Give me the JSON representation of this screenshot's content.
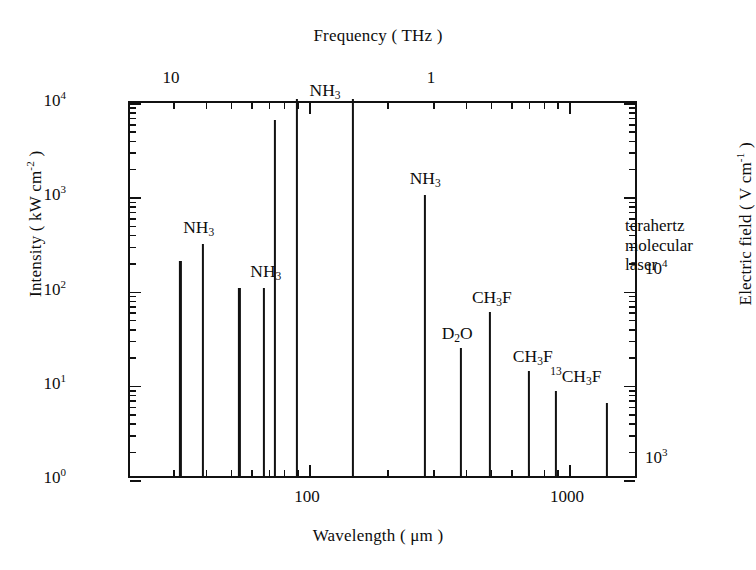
{
  "chart_data": {
    "type": "bar",
    "title": "",
    "xlabel": "Wavelength ( μm )",
    "ylabel": "Intensity ( kW cm⁻² )",
    "y2label": "Electric field ( V cm⁻¹ )",
    "x2label": "Frequency ( THz )",
    "xscale": "log",
    "yscale": "log",
    "xlim": [
      25,
      1500
    ],
    "ylim": [
      1,
      10000
    ],
    "y2lim": [
      780,
      78000
    ],
    "grid": false,
    "legend": "none",
    "annotation": "terahertz molecular laser",
    "xticks": [
      100,
      1000
    ],
    "xtick_labels": [
      "100",
      "1000"
    ],
    "x2ticks": [
      10,
      1
    ],
    "x2tick_labels": [
      "10",
      "1"
    ],
    "yticks": [
      1,
      10,
      100,
      1000,
      10000
    ],
    "ytick_labels": [
      "10⁰",
      "10¹",
      "10²",
      "10³",
      "10⁴"
    ],
    "y2ticks": [
      1000,
      10000
    ],
    "y2tick_labels": [
      "10³",
      "10⁴"
    ],
    "lines": [
      {
        "species": "NH3",
        "label_html": "NH<sub>3</sub>",
        "wavelength_um": 32,
        "intensity_kw_cm2": 190,
        "show_label": false
      },
      {
        "species": "NH3",
        "label_html": "NH<sub>3</sub>",
        "wavelength_um": 39,
        "intensity_kw_cm2": 290,
        "show_label": true
      },
      {
        "species": "NH3",
        "label_html": "NH<sub>3</sub>",
        "wavelength_um": 54,
        "intensity_kw_cm2": 100,
        "show_label": false
      },
      {
        "species": "NH3",
        "label_html": "NH<sub>3</sub>",
        "wavelength_um": 67,
        "intensity_kw_cm2": 100,
        "show_label": true
      },
      {
        "species": "NH3",
        "label_html": "NH<sub>3</sub>",
        "wavelength_um": 74,
        "intensity_kw_cm2": 6000,
        "show_label": false
      },
      {
        "species": "NH3",
        "label_html": "NH<sub>3</sub>",
        "wavelength_um": 90,
        "intensity_kw_cm2": 10000,
        "show_label": true
      },
      {
        "species": "NH3",
        "label_html": "NH<sub>3</sub>",
        "wavelength_um": 148,
        "intensity_kw_cm2": 10000,
        "show_label": false
      },
      {
        "species": "NH3",
        "label_html": "NH<sub>3</sub>",
        "wavelength_um": 280,
        "intensity_kw_cm2": 950,
        "show_label": true
      },
      {
        "species": "D2O",
        "label_html": "D<sub>2</sub>O",
        "wavelength_um": 385,
        "intensity_kw_cm2": 23,
        "show_label": true
      },
      {
        "species": "CH3F",
        "label_html": "CH<sub>3</sub>F",
        "wavelength_um": 496,
        "intensity_kw_cm2": 55,
        "show_label": true
      },
      {
        "species": "CH3F",
        "label_html": "CH<sub>3</sub>F",
        "wavelength_um": 700,
        "intensity_kw_cm2": 13,
        "show_label": true
      },
      {
        "species": "13CH3F",
        "label_html": "<sup>13</sup>CH<sub>3</sub>F",
        "wavelength_um": 890,
        "intensity_kw_cm2": 8,
        "show_label": true
      },
      {
        "species": "CH3F",
        "label_html": "CH<sub>3</sub>F",
        "wavelength_um": 1400,
        "intensity_kw_cm2": 6,
        "show_label": false
      }
    ]
  },
  "style": {
    "line_color": "#111111",
    "axis_color": "#111111",
    "background": "#ffffff"
  }
}
